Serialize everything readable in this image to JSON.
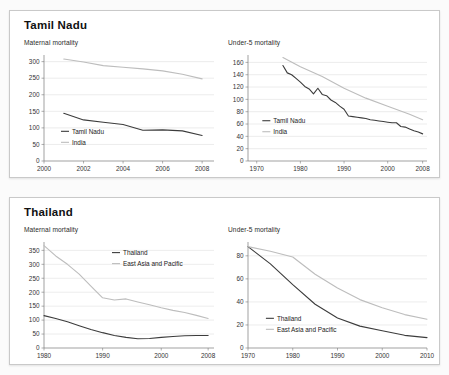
{
  "colors": {
    "primary_series": "#3c3c3c",
    "secondary_series": "#bdbdbd",
    "gridline": "#d8d8d8",
    "axis": "#7a7a7a",
    "panel_border": "#c9c9c9",
    "page_background": "#fbfbfb"
  },
  "panels": [
    {
      "title": "Tamil Nadu",
      "charts": [
        {
          "caption": "Maternal mortality",
          "chart_data": {
            "type": "line",
            "title": "Maternal mortality",
            "xlabel": "",
            "ylabel": "",
            "xlim": [
              2000,
              2008.6
            ],
            "ylim": [
              0,
              320
            ],
            "yticks": [
              0,
              50,
              100,
              150,
              200,
              250,
              300
            ],
            "xticks": [
              2000,
              2002,
              2004,
              2006,
              2008
            ],
            "ytick_labels": [
              "0",
              "50",
              "100",
              "150",
              "200",
              "250",
              "300"
            ],
            "xtick_labels": [
              "2000",
              "2002",
              "2004",
              "2006",
              "2008"
            ],
            "grid": true,
            "legend_position": "lower-left",
            "series": [
              {
                "name": "Tamil Nadu",
                "color": "#3c3c3c",
                "x": [
                  2001,
                  2002,
                  2003,
                  2004,
                  2005,
                  2006,
                  2007,
                  2008
                ],
                "values": [
                  144,
                  124,
                  117,
                  110,
                  93,
                  94,
                  91,
                  77
                ]
              },
              {
                "name": "India",
                "color": "#bdbdbd",
                "x": [
                  2001,
                  2002,
                  2003,
                  2004,
                  2005,
                  2006,
                  2007,
                  2008
                ],
                "values": [
                  308,
                  299,
                  288,
                  283,
                  278,
                  272,
                  262,
                  248
                ]
              }
            ]
          }
        },
        {
          "caption": "Under-5 mortality",
          "chart_data": {
            "type": "line",
            "title": "Under-5 mortality",
            "xlabel": "",
            "ylabel": "",
            "xlim": [
              1968,
              2009
            ],
            "ylim": [
              0,
              172
            ],
            "yticks": [
              0,
              20,
              40,
              60,
              80,
              100,
              120,
              140,
              160
            ],
            "xticks": [
              1970,
              1980,
              1990,
              2000,
              2008
            ],
            "ytick_labels": [
              "0",
              "20",
              "40",
              "60",
              "80",
              "100",
              "120",
              "140",
              "160"
            ],
            "xtick_labels": [
              "1970",
              "1980",
              "1990",
              "2000",
              "2008"
            ],
            "grid": true,
            "legend_position": "mid-left",
            "series": [
              {
                "name": "Tamil Nadu",
                "color": "#3c3c3c",
                "x": [
                  1976,
                  1977,
                  1978,
                  1979,
                  1980,
                  1981,
                  1982,
                  1983,
                  1984,
                  1985,
                  1986,
                  1987,
                  1988,
                  1989,
                  1990,
                  1991,
                  1992,
                  1993,
                  1994,
                  1995,
                  1996,
                  1997,
                  1998,
                  1999,
                  2000,
                  2001,
                  2002,
                  2003,
                  2004,
                  2005,
                  2006,
                  2007,
                  2008
                ],
                "values": [
                  155,
                  143,
                  140,
                  134,
                  128,
                  121,
                  117,
                  109,
                  118,
                  108,
                  106,
                  99,
                  95,
                  89,
                  84,
                  73,
                  72,
                  71,
                  70,
                  69,
                  67,
                  66,
                  65,
                  64,
                  63,
                  62,
                  62,
                  56,
                  55,
                  52,
                  49,
                  47,
                  44
                ]
              },
              {
                "name": "India",
                "color": "#bdbdbd",
                "x": [
                  1976,
                  1980,
                  1985,
                  1990,
                  1995,
                  2000,
                  2005,
                  2008
                ],
                "values": [
                  168,
                  153,
                  137,
                  118,
                  102,
                  89,
                  76,
                  67
                ]
              }
            ]
          }
        }
      ]
    },
    {
      "title": "Thailand",
      "charts": [
        {
          "caption": "Maternal mortality",
          "chart_data": {
            "type": "line",
            "title": "Maternal mortality",
            "xlabel": "",
            "ylabel": "",
            "xlim": [
              1980,
              2009
            ],
            "ylim": [
              0,
              380
            ],
            "yticks": [
              0,
              50,
              100,
              150,
              200,
              250,
              300,
              350
            ],
            "xticks": [
              1980,
              1990,
              2000,
              2008
            ],
            "ytick_labels": [
              "0",
              "50",
              "100",
              "150",
              "200",
              "250",
              "300",
              "350"
            ],
            "xtick_labels": [
              "1980",
              "1990",
              "2000",
              "2008"
            ],
            "grid": true,
            "legend_position": "upper-center",
            "series": [
              {
                "name": "Thailand",
                "color": "#3c3c3c",
                "x": [
                  1980,
                  1982,
                  1984,
                  1986,
                  1988,
                  1990,
                  1992,
                  1994,
                  1996,
                  1998,
                  2000,
                  2002,
                  2004,
                  2006,
                  2008
                ],
                "values": [
                  116,
                  106,
                  94,
                  80,
                  66,
                  55,
                  45,
                  38,
                  33,
                  34,
                  38,
                  41,
                  44,
                  45,
                  45
                ]
              },
              {
                "name": "East Asia and Pacific",
                "color": "#bdbdbd",
                "x": [
                  1980,
                  1982,
                  1984,
                  1986,
                  1988,
                  1990,
                  1992,
                  1994,
                  1996,
                  1998,
                  2000,
                  2002,
                  2004,
                  2006,
                  2008
                ],
                "values": [
                  367,
                  330,
                  300,
                  265,
                  222,
                  180,
                  172,
                  176,
                  165,
                  155,
                  144,
                  135,
                  127,
                  117,
                  106
                ]
              }
            ]
          }
        },
        {
          "caption": "Under-5 mortality",
          "chart_data": {
            "type": "line",
            "title": "Under-5 mortality",
            "xlabel": "",
            "ylabel": "",
            "xlim": [
              1970,
              2010
            ],
            "ylim": [
              0,
              92
            ],
            "yticks": [
              0,
              20,
              40,
              60,
              80
            ],
            "xticks": [
              1970,
              1980,
              1990,
              2000,
              2010
            ],
            "ytick_labels": [
              "0",
              "20",
              "40",
              "60",
              "80"
            ],
            "xtick_labels": [
              "1970",
              "1980",
              "1990",
              "2000",
              "2010"
            ],
            "grid": true,
            "legend_position": "lower-left",
            "series": [
              {
                "name": "Thailand",
                "color": "#3c3c3c",
                "x": [
                  1970,
                  1975,
                  1980,
                  1985,
                  1990,
                  1995,
                  2000,
                  2005,
                  2010
                ],
                "values": [
                  88,
                  73,
                  55,
                  38,
                  26,
                  19,
                  15,
                  11,
                  9
                ]
              },
              {
                "name": "East Asia and Pacific",
                "color": "#bdbdbd",
                "x": [
                  1970,
                  1975,
                  1980,
                  1985,
                  1990,
                  1995,
                  2000,
                  2005,
                  2010
                ],
                "values": [
                  88,
                  84,
                  79,
                  64,
                  52,
                  42,
                  35,
                  29,
                  25
                ]
              }
            ]
          }
        }
      ]
    }
  ]
}
